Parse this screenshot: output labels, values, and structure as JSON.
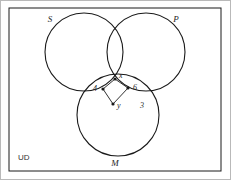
{
  "figure": {
    "type": "venn-diagram",
    "universe_label": "UD",
    "background_color": "#ffffff",
    "stroke_color": "#1a1a1a",
    "frame_color": "#b9b9b9",
    "sets": [
      {
        "id": "S",
        "label": "S",
        "cx": 84,
        "cy": 52,
        "r": 39,
        "label_x": 50,
        "label_y": 22
      },
      {
        "id": "P",
        "label": "P",
        "cx": 146,
        "cy": 52,
        "r": 39,
        "label_x": 176,
        "label_y": 22
      },
      {
        "id": "M",
        "label": "M",
        "cx": 118,
        "cy": 115,
        "r": 41,
        "label_x": 115,
        "label_y": 166
      }
    ],
    "points": [
      {
        "id": "x",
        "label": "x",
        "x": 115,
        "y": 79,
        "label_x": 119,
        "label_y": 78
      },
      {
        "id": "p4",
        "label": "4",
        "x": 103,
        "y": 89,
        "label_x": 93,
        "label_y": 91
      },
      {
        "id": "p6",
        "label": "6",
        "x": 128,
        "y": 88,
        "label_x": 133,
        "label_y": 90
      },
      {
        "id": "y",
        "label": "y",
        "x": 113,
        "y": 104,
        "label_x": 117,
        "label_y": 108
      }
    ],
    "segments": [
      {
        "from": "p4",
        "to": "x"
      },
      {
        "from": "x",
        "to": "p6"
      },
      {
        "from": "p6",
        "to": "y"
      },
      {
        "from": "y",
        "to": "p4"
      }
    ],
    "region_labels": [
      {
        "id": "three",
        "label": "3",
        "x": 142,
        "y": 108
      }
    ],
    "outer_frame": {
      "x": 9,
      "y": 8,
      "width": 212,
      "height": 163
    }
  }
}
